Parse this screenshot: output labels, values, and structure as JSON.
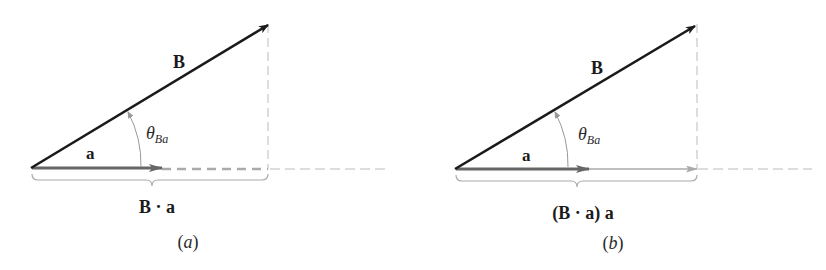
{
  "figure": {
    "panels": [
      {
        "id": "a",
        "caption_letter": "a",
        "vector_B_label": "B",
        "vector_a_label": "a",
        "angle_label": "θ",
        "angle_subscript": "Ba",
        "brace_label": "B · a"
      },
      {
        "id": "b",
        "caption_letter": "b",
        "vector_B_label": "B",
        "vector_a_label": "a",
        "angle_label": "θ",
        "angle_subscript": "Ba",
        "brace_label": "(B · a) a"
      }
    ],
    "colors": {
      "vector_B": "#1a1a1a",
      "vector_a": "#666666",
      "projection": "#aaaaaa",
      "guide": "#bbbbbb"
    }
  }
}
